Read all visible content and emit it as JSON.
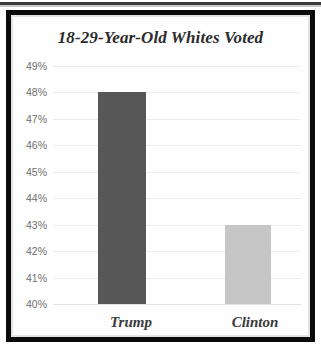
{
  "chart_data": {
    "type": "bar",
    "title": "18-29-Year-Old Whites Voted",
    "xlabel": "",
    "ylabel": "",
    "categories": [
      "Trump",
      "Clinton"
    ],
    "values": [
      48,
      43
    ],
    "value_labels": [
      "48%",
      "43%"
    ],
    "ylim": [
      40,
      49
    ],
    "ytick_labels": [
      "49%",
      "48%",
      "47%",
      "46%",
      "45%",
      "44%",
      "43%",
      "42%",
      "41%",
      "40%"
    ],
    "ytick_values": [
      49,
      48,
      47,
      46,
      45,
      44,
      43,
      42,
      41,
      40
    ],
    "grid": true,
    "legend": "none",
    "series": [
      {
        "name": "Percent voted",
        "values": [
          48,
          43
        ],
        "colors": [
          "#575757",
          "#c6c6c6"
        ]
      }
    ],
    "colors": {
      "trump_bar": "#575757",
      "clinton_bar": "#c6c6c6",
      "gridline": "#ededed",
      "title_text": "#2b2b2b",
      "tick_text": "#6f6f6f",
      "axis_label_text": "#3a3a3a",
      "frame": "#0b0b0b",
      "background": "#ffffff"
    }
  }
}
